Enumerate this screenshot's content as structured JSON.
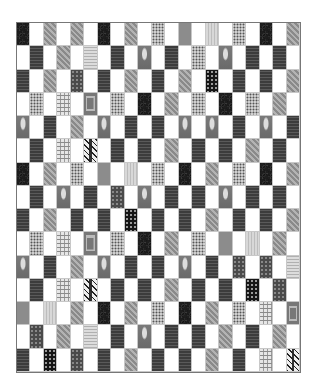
{
  "quilt": {
    "columns": 21,
    "rows_count": 15,
    "pattern_legend": {
      ".": "white-square",
      "D": "dark-circles-fabric",
      "M": "medium-damask-fabric",
      "K": "dark-tapestry-fabric",
      "S": "speckled-fabric",
      "G": "flat-gray-fabric",
      "L": "pale-stripe-fabric",
      "V": "vase-motif-fabric",
      "F": "dark-floral-fabric",
      "P": "plaid-fabric",
      "Z": "vine-stitch-fabric",
      "Q": "square-frame-fabric",
      "W": "woven-stripe-fabric",
      "B": "black-floral-fabric"
    },
    "rows": [
      "D.M.M.D.M.S.G.L.S.D.M",
      ".K.M.W.K.V.K.S.V.K.K.",
      "K.M.F.K.M.K.M.B.K.K.M",
      ".S.P.Q.S.D.M.S.D.S.M.",
      "V.K.M.V.K.K.V.V.K.V.K",
      ".K.P.Z.K.K.M.K.K.M.K.",
      "D.M.S.G.L.S.D.M.S.D.M",
      ".K.V.K.F.V.K.K.V.K.K.",
      "K.M.K.K.B.K.K.M.K.K.M",
      ".S.P.Q.S.D.M.S.G.L.M.",
      "V.K.M.V.K.K.V.K.F.F.W",
      ".K.P.Z.K.K.M.K.K.B.F.",
      "G.L.M.D.M.S.D.M.S.P.Q",
      ".F.M.W.K.V.K.K.M.K.M.",
      "K.B.F.K.M.K.K.M.K.P.Z"
    ]
  }
}
